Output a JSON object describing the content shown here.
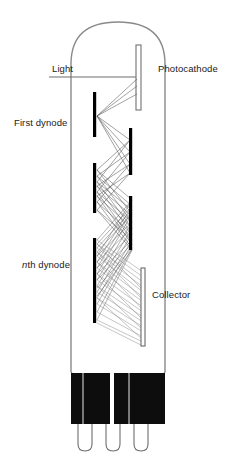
{
  "diagram": {
    "labels": {
      "light": "Light",
      "photocathode": "Photocathode",
      "first_dynode_prefix": "",
      "first_dynode": "First dynode",
      "nth_dynode_italic": "n",
      "nth_dynode_rest": "th dynode",
      "collector": "Collector"
    },
    "colors": {
      "background": "#ffffff",
      "outline": "#8a8a8a",
      "electrode": "#000000",
      "base": "#0d0d0d",
      "ray": "#6e6e6e",
      "text": "#1a1a1a"
    },
    "geometry": {
      "tube_left": 71,
      "tube_right": 165,
      "tube_top": 20,
      "tube_bottom": 372,
      "dome_radius": 44,
      "base_top": 372,
      "base_bottom": 424,
      "pin_count": 3,
      "pin_bottom": 452
    },
    "elements": [
      {
        "name": "photocathode",
        "type": "hollow-plate",
        "x": 138,
        "y1": 45,
        "y2": 110
      },
      {
        "name": "dynode-1",
        "type": "plate",
        "x": 95,
        "y1": 92,
        "y2": 137
      },
      {
        "name": "dynode-2",
        "type": "plate",
        "x": 131,
        "y1": 128,
        "y2": 175
      },
      {
        "name": "dynode-3",
        "type": "plate",
        "x": 95,
        "y1": 163,
        "y2": 213
      },
      {
        "name": "dynode-4",
        "type": "plate",
        "x": 131,
        "y1": 196,
        "y2": 250
      },
      {
        "name": "dynode-n",
        "type": "plate",
        "x": 95,
        "y1": 238,
        "y2": 323
      },
      {
        "name": "collector",
        "type": "hollow-plate",
        "x": 142,
        "y1": 268,
        "y2": 345
      }
    ]
  }
}
